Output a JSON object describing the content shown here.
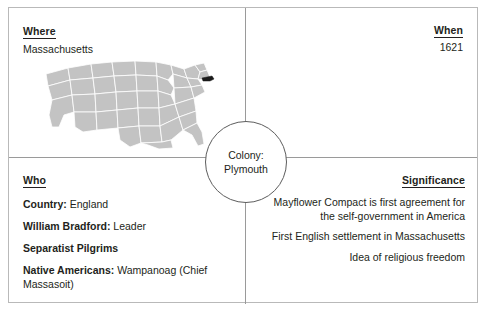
{
  "center": {
    "line1": "Colony:",
    "line2": "Plymouth"
  },
  "quadrants": {
    "where": {
      "heading": "Where",
      "value": "Massachusetts",
      "map": {
        "name": "united-states-map",
        "land_color": "#c3c3c3",
        "border_color": "#ffffff",
        "highlight_state": "Massachusetts",
        "highlight_color": "#1a1a1a"
      }
    },
    "when": {
      "heading": "When",
      "value": "1621"
    },
    "who": {
      "heading": "Who",
      "rows": [
        {
          "label": "Country:",
          "value": "England"
        },
        {
          "label": "William Bradford:",
          "value": "Leader"
        },
        {
          "label": "Separatist Pilgrims",
          "value": ""
        },
        {
          "label": "Native Americans:",
          "value": "Wampanoag (Chief Massasoit)"
        }
      ]
    },
    "significance": {
      "heading": "Significance",
      "items": [
        "Mayflower Compact is first agreement for the self-government in America",
        "First English settlement in Massachusetts",
        "Idea of religious freedom"
      ]
    }
  },
  "colors": {
    "text": "#231f20",
    "outer_border": "#b9b9b9",
    "divider": "#9a9a9a",
    "circle_stroke": "#5d5d5d",
    "background": "#ffffff"
  }
}
